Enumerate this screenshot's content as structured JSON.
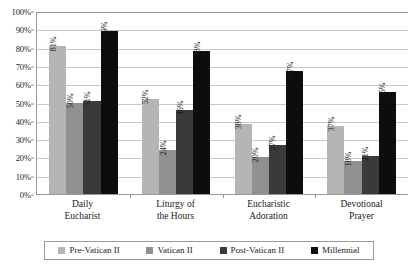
{
  "chart_data": {
    "type": "bar",
    "title": "",
    "subtitle": "",
    "xlabel": "",
    "ylabel": "",
    "ylim": [
      0,
      100
    ],
    "grid": true,
    "legend_position": "bottom",
    "value_label_suffix": "%",
    "value_labels_rotated": true,
    "categories": [
      "Daily\nEucharist",
      "Liturgy of\nthe Hours",
      "Eucharistic\nAdoration",
      "Devotional\nPrayer"
    ],
    "category_lines": [
      [
        "Daily",
        "Eucharist"
      ],
      [
        "Liturgy of",
        "the Hours"
      ],
      [
        "Eucharistic",
        "Adoration"
      ],
      [
        "Devotional",
        "Prayer"
      ]
    ],
    "ytick_labels": [
      "100%",
      "90%",
      "80%",
      "70%",
      "60%",
      "50%",
      "40%",
      "30%",
      "20%",
      "10%",
      "0%"
    ],
    "ytick_values": [
      100,
      90,
      80,
      70,
      60,
      50,
      40,
      30,
      20,
      10,
      0
    ],
    "series": [
      {
        "name": "Pre-Vatican II",
        "color": "#b5b5b5",
        "values": [
          81,
          52,
          38,
          37
        ],
        "labels": [
          "81%",
          "52%",
          "38%",
          "37%"
        ]
      },
      {
        "name": "Vatican II",
        "color": "#909090",
        "values": [
          50,
          24,
          20,
          18
        ],
        "labels": [
          "50%",
          "24%",
          "20%",
          "18%"
        ]
      },
      {
        "name": "Post-Vatican II",
        "color": "#3a3a3a",
        "values": [
          51,
          46,
          27,
          21
        ],
        "labels": [
          "51%",
          "46%",
          "27%",
          "21%"
        ]
      },
      {
        "name": "Millennial",
        "color": "#0d0d0d",
        "values": [
          89,
          78,
          67,
          56
        ],
        "labels": [
          "89%",
          "78%",
          "67%",
          "56%"
        ]
      }
    ]
  },
  "colors": {
    "background": "#ffffff",
    "gridline": "#c8c8c8",
    "axis": "#9a9a9a",
    "text": "#1a1a1a"
  }
}
